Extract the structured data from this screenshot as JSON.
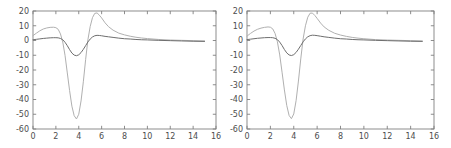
{
  "figure": {
    "title": "",
    "panel_count": 2,
    "background_color": "#ffffff"
  },
  "chart_data": [
    {
      "type": "line",
      "panel": "left",
      "title": "",
      "xlabel": "",
      "ylabel": "",
      "xlim": [
        0,
        16
      ],
      "ylim": [
        -60,
        20
      ],
      "grid": false,
      "legend": null,
      "xticks": [
        0,
        2,
        4,
        6,
        8,
        10,
        12,
        14,
        16
      ],
      "yticks": [
        20,
        10,
        0,
        -10,
        -20,
        -30,
        -40,
        -50,
        -60
      ],
      "xticklabels": [
        "0",
        "2",
        "4",
        "6",
        "8",
        "10",
        "12",
        "14",
        "16"
      ],
      "yticklabels": [
        "20",
        "10",
        "0",
        "-10",
        "-20",
        "-30",
        "-40",
        "-50",
        "-60"
      ],
      "x_data_range": [
        0,
        15
      ],
      "series": [
        {
          "name": "light-gray-curve",
          "color": "#b0b0b0",
          "linewidth": 1.0,
          "x": [
            0.0,
            0.3,
            0.6,
            0.9,
            1.2,
            1.5,
            1.8,
            2.0,
            2.2,
            2.4,
            2.6,
            2.8,
            3.0,
            3.2,
            3.4,
            3.6,
            3.8,
            4.0,
            4.2,
            4.4,
            4.6,
            4.8,
            5.0,
            5.2,
            5.4,
            5.6,
            5.8,
            6.0,
            6.3,
            6.6,
            7.0,
            7.5,
            8.0,
            8.5,
            9.0,
            9.5,
            10.0,
            11.0,
            12.0,
            13.0,
            14.0,
            15.0
          ],
          "values": [
            3.3,
            5.0,
            6.6,
            7.8,
            8.5,
            8.9,
            9.0,
            8.7,
            7.6,
            4.5,
            -1.0,
            -10.0,
            -22.0,
            -34.0,
            -44.5,
            -51.0,
            -53.2,
            -50.0,
            -41.0,
            -28.0,
            -13.0,
            0.5,
            9.5,
            15.5,
            18.4,
            18.7,
            17.2,
            15.3,
            12.0,
            9.4,
            7.0,
            5.0,
            3.8,
            2.9,
            2.2,
            1.7,
            1.3,
            0.7,
            0.3,
            0.1,
            -0.1,
            -0.3
          ]
        },
        {
          "name": "dark-gray-curve",
          "color": "#6e6e6e",
          "linewidth": 1.0,
          "x": [
            0.0,
            0.3,
            0.6,
            0.9,
            1.2,
            1.5,
            1.8,
            2.0,
            2.2,
            2.4,
            2.6,
            2.8,
            3.0,
            3.2,
            3.4,
            3.6,
            3.8,
            4.0,
            4.2,
            4.4,
            4.6,
            4.8,
            5.0,
            5.2,
            5.4,
            5.6,
            5.8,
            6.0,
            6.3,
            6.6,
            7.0,
            7.5,
            8.0,
            8.5,
            9.0,
            9.5,
            10.0,
            11.0,
            12.0,
            13.0,
            14.0,
            15.0
          ],
          "values": [
            0.5,
            0.8,
            1.1,
            1.4,
            1.6,
            1.8,
            1.9,
            1.9,
            1.8,
            1.4,
            0.5,
            -1.2,
            -3.5,
            -6.2,
            -8.5,
            -9.9,
            -10.3,
            -9.7,
            -8.2,
            -6.0,
            -3.5,
            -1.0,
            1.0,
            2.4,
            3.2,
            3.5,
            3.4,
            3.2,
            2.8,
            2.5,
            2.1,
            1.6,
            1.2,
            1.0,
            0.7,
            0.5,
            0.4,
            0.1,
            -0.1,
            -0.3,
            -0.5,
            -0.6
          ]
        }
      ]
    },
    {
      "type": "line",
      "panel": "right",
      "title": "",
      "xlabel": "",
      "ylabel": "",
      "xlim": [
        0,
        16
      ],
      "ylim": [
        -60,
        20
      ],
      "grid": false,
      "legend": null,
      "xticks": [
        0,
        2,
        4,
        6,
        8,
        10,
        12,
        14,
        16
      ],
      "yticks": [
        20,
        10,
        0,
        -10,
        -20,
        -30,
        -40,
        -50,
        -60
      ],
      "xticklabels": [
        "0",
        "2",
        "4",
        "6",
        "8",
        "10",
        "12",
        "14",
        "16"
      ],
      "yticklabels": [
        "20",
        "10",
        "0",
        "-10",
        "-20",
        "-30",
        "-40",
        "-50",
        "-60"
      ],
      "x_data_range": [
        0,
        15
      ],
      "series": [
        {
          "name": "light-gray-curve",
          "color": "#b0b0b0",
          "linewidth": 1.0,
          "x": [
            0.0,
            0.3,
            0.6,
            0.9,
            1.2,
            1.5,
            1.8,
            2.0,
            2.2,
            2.4,
            2.6,
            2.8,
            3.0,
            3.2,
            3.4,
            3.6,
            3.8,
            4.0,
            4.2,
            4.4,
            4.6,
            4.8,
            5.0,
            5.2,
            5.4,
            5.6,
            5.8,
            6.0,
            6.3,
            6.6,
            7.0,
            7.5,
            8.0,
            8.5,
            9.0,
            9.5,
            10.0,
            11.0,
            12.0,
            13.0,
            14.0,
            15.0
          ],
          "values": [
            3.0,
            4.8,
            6.4,
            7.6,
            8.4,
            8.9,
            9.2,
            9.0,
            7.9,
            4.8,
            -0.8,
            -9.8,
            -21.5,
            -33.5,
            -44.0,
            -50.8,
            -53.0,
            -49.8,
            -40.8,
            -27.5,
            -12.5,
            1.0,
            10.0,
            15.8,
            18.5,
            18.6,
            17.0,
            15.0,
            11.8,
            9.2,
            6.9,
            4.9,
            3.7,
            2.8,
            2.1,
            1.6,
            1.2,
            0.6,
            0.3,
            0.1,
            -0.1,
            -0.3
          ]
        },
        {
          "name": "dark-gray-curve",
          "color": "#6e6e6e",
          "linewidth": 1.0,
          "x": [
            0.0,
            0.3,
            0.6,
            0.9,
            1.2,
            1.5,
            1.8,
            2.0,
            2.2,
            2.4,
            2.6,
            2.8,
            3.0,
            3.2,
            3.4,
            3.6,
            3.8,
            4.0,
            4.2,
            4.4,
            4.6,
            4.8,
            5.0,
            5.2,
            5.4,
            5.6,
            5.8,
            6.0,
            6.3,
            6.6,
            7.0,
            7.5,
            8.0,
            8.5,
            9.0,
            9.5,
            10.0,
            11.0,
            12.0,
            13.0,
            14.0,
            15.0
          ],
          "values": [
            0.6,
            0.9,
            1.2,
            1.5,
            1.7,
            1.9,
            2.0,
            2.0,
            1.9,
            1.5,
            0.6,
            -1.1,
            -3.4,
            -6.1,
            -8.4,
            -9.8,
            -10.2,
            -9.6,
            -8.1,
            -5.9,
            -3.4,
            -0.9,
            1.1,
            2.5,
            3.3,
            3.6,
            3.5,
            3.3,
            2.9,
            2.5,
            2.1,
            1.6,
            1.2,
            1.0,
            0.7,
            0.5,
            0.4,
            0.1,
            -0.1,
            -0.3,
            -0.5,
            -0.6
          ]
        }
      ]
    }
  ],
  "style": {
    "axis_color": "#808080",
    "tick_label_color": "#4d4d4d",
    "series_light": "#b0b0b0",
    "series_dark": "#6e6e6e"
  }
}
